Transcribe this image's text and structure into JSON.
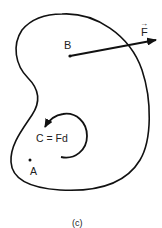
{
  "figure": {
    "caption": "(c)",
    "body_outline": "irregular kidney-shaped rigid body",
    "points": {
      "B": {
        "label": "B"
      },
      "A": {
        "label": "A"
      }
    },
    "force": {
      "label": "F",
      "vector_arrow": "→",
      "applied_at": "B"
    },
    "couple": {
      "label": "C = Fd",
      "direction": "counterclockwise"
    },
    "colors": {
      "stroke": "#111111",
      "background": "#ffffff"
    }
  }
}
